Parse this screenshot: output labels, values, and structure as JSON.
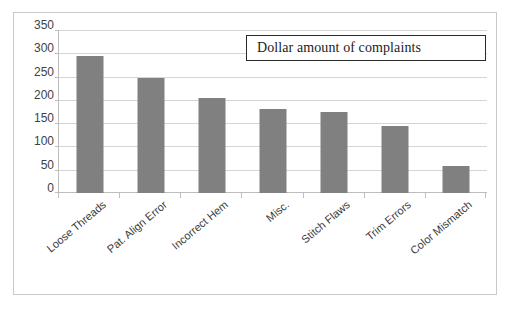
{
  "chart_data": {
    "type": "bar",
    "title": "Dollar amount of complaints",
    "xlabel": "",
    "ylabel": "",
    "ylim": [
      0,
      350
    ],
    "ytick_step": 50,
    "grid": true,
    "legend_position": "top-right-box",
    "bar_color": "#808080",
    "categories": [
      "Loose Threads",
      "Pat. Align Error",
      "Incorrect Hem",
      "Misc.",
      "Stitch Flaws",
      "Trim Errors",
      "Color Mismatch"
    ],
    "values": [
      295,
      248,
      205,
      180,
      175,
      143,
      57
    ],
    "ytick_labels": [
      "350",
      "300",
      "250",
      "200",
      "150",
      "100",
      "50",
      "0"
    ],
    "series": [
      {
        "name": "Dollar amount of complaints",
        "values": [
          295,
          248,
          205,
          180,
          175,
          143,
          57
        ]
      }
    ]
  },
  "legend": {
    "label": "Dollar amount of complaints"
  }
}
